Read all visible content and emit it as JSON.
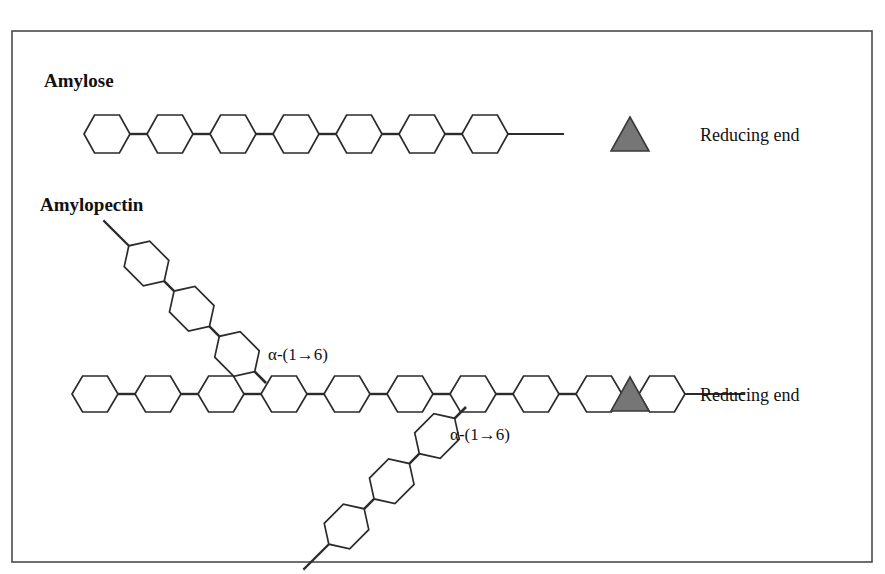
{
  "figure": {
    "title_fragment_top": "",
    "frame": {
      "x": 12,
      "y": 31,
      "width": 860,
      "height": 531,
      "stroke": "#4a4a4a"
    },
    "canvas": {
      "width": 885,
      "height": 574
    },
    "colors": {
      "ink": "#2b2b2b",
      "frame": "#4a4a4a",
      "reducing_end_fill": "#767676",
      "reducing_end_stroke": "#3a3a3a",
      "background": "#ffffff"
    }
  },
  "sections": [
    {
      "id": "amylose",
      "label": "Amylose",
      "label_pos": {
        "x": 44,
        "y": 87
      },
      "chain": {
        "name": "amylose-main-chain",
        "ring_count": 7,
        "start_x": 84,
        "y": 134,
        "ring_width": 46,
        "ring_height": 38,
        "bond_length": 17,
        "tail_length": 56,
        "orientation": "horizontal"
      },
      "reducing_end": {
        "label": "Reducing end",
        "label_pos": {
          "x": 700,
          "y": 141
        },
        "marker": {
          "cx": 630,
          "cy": 134,
          "half_width": 19,
          "height": 34
        }
      }
    },
    {
      "id": "amylopectin",
      "label": "Amylopectin",
      "label_pos": {
        "x": 40,
        "y": 211
      },
      "chain": {
        "name": "amylopectin-main-chain",
        "ring_count": 10,
        "start_x": 72,
        "y": 394,
        "ring_width": 46,
        "ring_height": 36,
        "bond_length": 17,
        "tail_length": 60,
        "orientation": "horizontal"
      },
      "reducing_end": {
        "label": "Reducing end",
        "label_pos": {
          "x": 700,
          "y": 401
        },
        "marker": {
          "cx": 630,
          "cy": 394,
          "half_width": 19,
          "height": 34
        }
      },
      "branches": [
        {
          "name": "upper-branch",
          "ring_count": 3,
          "attach": {
            "x": 266,
            "y": 383
          },
          "direction": "up-left",
          "angle_deg": -135,
          "ring_length": 50,
          "ring_width": 36,
          "bond_length": 14,
          "tail_length": 36,
          "link_label": "α-(1→6)",
          "link_label_pos": {
            "x": 268,
            "y": 360
          }
        },
        {
          "name": "lower-branch",
          "ring_count": 3,
          "attach": {
            "x": 466,
            "y": 407
          },
          "direction": "down-left",
          "angle_deg": 135,
          "ring_length": 50,
          "ring_width": 36,
          "bond_length": 14,
          "tail_length": 36,
          "link_label": "α-(1→6)",
          "link_label_pos": {
            "x": 450,
            "y": 440
          }
        }
      ]
    }
  ],
  "legend": {
    "reducing_end_text": "Reducing end",
    "alpha_1_6_text": "α-(1→6)"
  }
}
